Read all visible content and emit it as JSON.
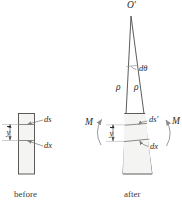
{
  "figure": {
    "stroke_color": "#4a4a4a",
    "fill_color": "#f4f4f2",
    "text_color": "#2b2b2b",
    "arrow_color": "#8a8a8a"
  },
  "captions": {
    "before": "before",
    "after": "after"
  },
  "before_figure": {
    "labels": {
      "ds": "ds",
      "dx": "dx",
      "y_bar": "y"
    }
  },
  "after_figure": {
    "labels": {
      "center_of_curvature": "O′",
      "d_theta": "dθ",
      "rho_left": "ρ",
      "rho_right": "ρ",
      "ds_prime": "ds′",
      "dx": "dx",
      "y_bar": "y",
      "moment_left": "M",
      "moment_right": "M"
    }
  }
}
